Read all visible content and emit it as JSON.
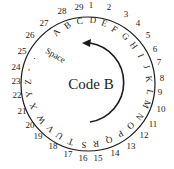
{
  "diagram": {
    "title": "Code B",
    "wheel": {
      "cx": 88,
      "cy": 84,
      "r": 67,
      "stroke": "#1a1a1a"
    },
    "arrow": {
      "direction": "counter-clockwise",
      "cx": 88,
      "cy": 82,
      "r": 40
    },
    "numbers": [
      {
        "label": "1",
        "x": 91,
        "y": 8
      },
      {
        "label": "2",
        "x": 109,
        "y": 10
      },
      {
        "label": "3",
        "x": 126,
        "y": 17
      },
      {
        "label": "4",
        "x": 138,
        "y": 26
      },
      {
        "label": "5",
        "x": 148,
        "y": 38
      },
      {
        "label": "6",
        "x": 155,
        "y": 52
      },
      {
        "label": "7",
        "x": 159,
        "y": 65
      },
      {
        "label": "8",
        "x": 162,
        "y": 81
      },
      {
        "label": "9",
        "x": 160,
        "y": 95
      },
      {
        "label": "10",
        "x": 161,
        "y": 112
      },
      {
        "label": "11",
        "x": 153,
        "y": 127
      },
      {
        "label": "12",
        "x": 144,
        "y": 138
      },
      {
        "label": "13",
        "x": 131,
        "y": 149
      },
      {
        "label": "14",
        "x": 115,
        "y": 156
      },
      {
        "label": "15",
        "x": 98,
        "y": 161
      },
      {
        "label": "16",
        "x": 83,
        "y": 161
      },
      {
        "label": "17",
        "x": 68,
        "y": 157
      },
      {
        "label": "18",
        "x": 53,
        "y": 149
      },
      {
        "label": "19",
        "x": 38,
        "y": 139
      },
      {
        "label": "20",
        "x": 30,
        "y": 128
      },
      {
        "label": "21",
        "x": 22,
        "y": 114
      },
      {
        "label": "22",
        "x": 17,
        "y": 98
      },
      {
        "label": "23",
        "x": 16,
        "y": 84
      },
      {
        "label": "24",
        "x": 16,
        "y": 70
      },
      {
        "label": "25",
        "x": 22,
        "y": 54
      },
      {
        "label": "26",
        "x": 30,
        "y": 38
      },
      {
        "label": "27",
        "x": 44,
        "y": 26
      },
      {
        "label": "28",
        "x": 62,
        "y": 14
      },
      {
        "label": "29",
        "x": 79,
        "y": 10
      }
    ],
    "letters": [
      {
        "label": "A",
        "x": 57,
        "y": 33,
        "rot": -48
      },
      {
        "label": "B",
        "x": 68,
        "y": 26,
        "rot": -35
      },
      {
        "label": "C",
        "x": 80,
        "y": 22,
        "rot": -15
      },
      {
        "label": "D",
        "x": 93,
        "y": 21,
        "rot": 5
      },
      {
        "label": "E",
        "x": 104,
        "y": 24,
        "rot": 20
      },
      {
        "label": "F",
        "x": 114,
        "y": 30,
        "rot": 35
      },
      {
        "label": "G",
        "x": 125,
        "y": 37,
        "rot": 45
      },
      {
        "label": "H",
        "x": 133,
        "y": 46,
        "rot": 55
      },
      {
        "label": "I",
        "x": 140,
        "y": 56,
        "rot": 65
      },
      {
        "label": "J",
        "x": 146,
        "y": 67,
        "rot": 75
      },
      {
        "label": "K",
        "x": 148,
        "y": 79,
        "rot": 85
      },
      {
        "label": "L",
        "x": 149,
        "y": 92,
        "rot": 100
      },
      {
        "label": "M",
        "x": 146,
        "y": 104,
        "rot": 115
      },
      {
        "label": "N",
        "x": 139,
        "y": 116,
        "rot": 130
      },
      {
        "label": "O",
        "x": 130,
        "y": 125,
        "rot": 140
      },
      {
        "label": "P",
        "x": 120,
        "y": 133,
        "rot": 150
      },
      {
        "label": "Q",
        "x": 109,
        "y": 139,
        "rot": 165
      },
      {
        "label": "R",
        "x": 96,
        "y": 143,
        "rot": 175
      },
      {
        "label": "S",
        "x": 84,
        "y": 144,
        "rot": -175
      },
      {
        "label": "T",
        "x": 71,
        "y": 141,
        "rot": -160
      },
      {
        "label": "U",
        "x": 60,
        "y": 135,
        "rot": -145
      },
      {
        "label": "V",
        "x": 51,
        "y": 128,
        "rot": -130
      },
      {
        "label": "W",
        "x": 42,
        "y": 119,
        "rot": -120
      },
      {
        "label": "X",
        "x": 34,
        "y": 106,
        "rot": -110
      },
      {
        "label": "Y",
        "x": 30,
        "y": 94,
        "rot": -100
      },
      {
        "label": "Z",
        "x": 29,
        "y": 82,
        "rot": -90
      },
      {
        "label": "-",
        "x": 29,
        "y": 70,
        "rot": -80
      },
      {
        "label": ".",
        "x": 33,
        "y": 58,
        "rot": -70
      },
      {
        "label": "Space",
        "x": 55,
        "y": 56,
        "rot": 30
      }
    ]
  }
}
